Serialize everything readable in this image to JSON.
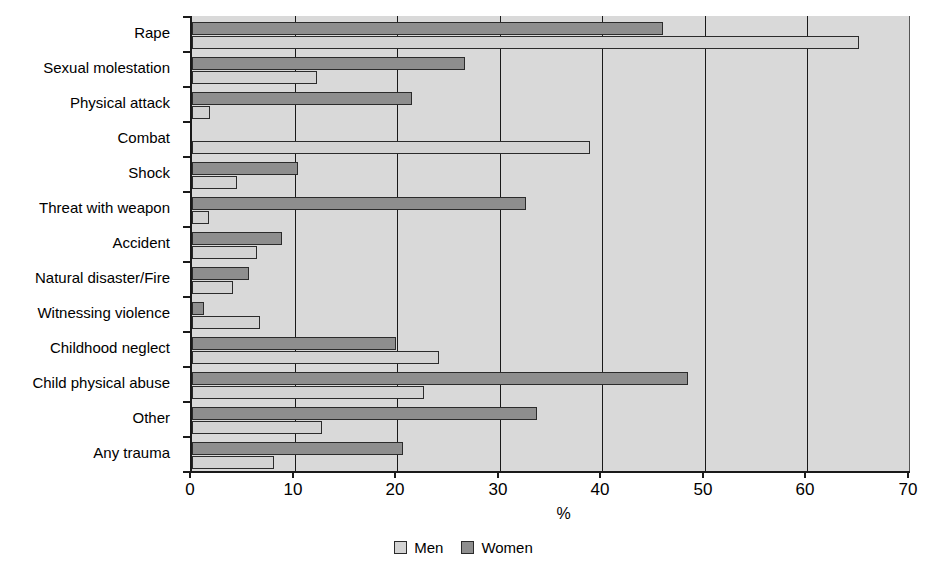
{
  "chart_data": {
    "type": "bar",
    "orientation": "horizontal",
    "title": "",
    "xlabel": "%",
    "ylabel": "",
    "xlim": [
      0,
      70
    ],
    "xticks": [
      0,
      10,
      20,
      30,
      40,
      50,
      60,
      70
    ],
    "xtick_labels": [
      "0",
      "10",
      "20",
      "30",
      "40",
      "50",
      "60",
      "70"
    ],
    "grid": "vertical",
    "legend_position": "bottom-center",
    "categories": [
      "Rape",
      "Sexual molestation",
      "Physical attack",
      "Combat",
      "Shock",
      "Threat with weapon",
      "Accident",
      "Natural disaster/Fire",
      "Witnessing violence",
      "Childhood neglect",
      "Child physical abuse",
      "Other",
      "Any trauma"
    ],
    "series": [
      {
        "name": "Men",
        "color": "#d3d3d3",
        "values": [
          65.0,
          12.2,
          1.8,
          38.8,
          4.4,
          1.7,
          6.3,
          4.0,
          6.6,
          24.1,
          22.6,
          12.7,
          8.0
        ]
      },
      {
        "name": "Women",
        "color": "#8e8e8e",
        "values": [
          45.9,
          26.6,
          21.4,
          0.0,
          10.3,
          32.6,
          8.8,
          5.6,
          1.2,
          19.9,
          48.4,
          33.6,
          20.6
        ]
      }
    ]
  },
  "legend": {
    "items": [
      {
        "label": "Men",
        "swatch": "men-swatch"
      },
      {
        "label": "Women",
        "swatch": "women-swatch"
      }
    ]
  },
  "colors": {
    "plot_background": "#d9d9d9",
    "axis": "#1a1a1a",
    "men": "#d3d3d3",
    "women": "#8e8e8e"
  }
}
